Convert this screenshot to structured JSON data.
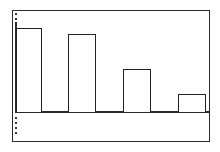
{
  "chart_data": {
    "type": "bar",
    "title": "",
    "xlabel": "",
    "ylabel": "",
    "categories": [
      "",
      "",
      "",
      ""
    ],
    "values": [
      85,
      79,
      43,
      18
    ],
    "ylim": [
      0,
      100
    ],
    "grid": false,
    "legend": null,
    "style": {
      "bar_fill": "#ffffff",
      "bar_stroke": "#222222",
      "frame_color": "#2a2a2a"
    }
  },
  "layout": {
    "plot": {
      "left": 16,
      "right": 210,
      "baseline_y": 112,
      "top_y": 13
    },
    "bars": [
      {
        "left": 16,
        "width": 26
      },
      {
        "left": 68,
        "width": 28
      },
      {
        "left": 123,
        "width": 28
      },
      {
        "left": 178,
        "width": 28
      }
    ]
  }
}
